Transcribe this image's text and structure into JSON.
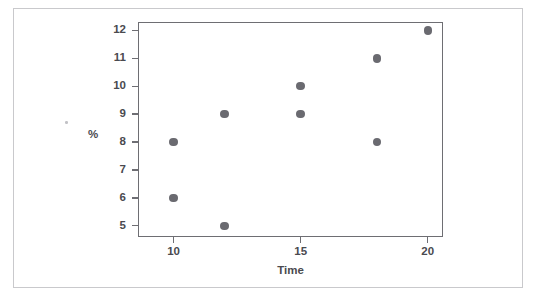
{
  "figure": {
    "background_color": "#ffffff",
    "frame_color": "#c9c9cc",
    "axis_color": "#6e6e73",
    "point_color": "#6a6a70",
    "text_color": "#4a4a4f"
  },
  "chart_data": {
    "type": "scatter",
    "title": "",
    "subtitle": "",
    "xlabel": "Time",
    "ylabel": "%",
    "xlim": [
      8.6,
      20.6
    ],
    "ylim": [
      4.6,
      12.3
    ],
    "xticks": [
      10,
      15,
      20
    ],
    "xticklabels": [
      "10",
      "15",
      "20"
    ],
    "yticks": [
      5,
      6,
      7,
      8,
      9,
      10,
      11,
      12
    ],
    "yticklabels": [
      "5",
      "6",
      "7",
      "8",
      "9",
      "10",
      "11",
      "12"
    ],
    "grid": false,
    "legend": null,
    "legend_position": "none",
    "marker": "filled-circle",
    "marker_color": "#6a6a70",
    "points": [
      {
        "x": 10,
        "y": 8
      },
      {
        "x": 10,
        "y": 6
      },
      {
        "x": 12,
        "y": 9
      },
      {
        "x": 12,
        "y": 5
      },
      {
        "x": 15,
        "y": 10
      },
      {
        "x": 15,
        "y": 9
      },
      {
        "x": 18,
        "y": 11
      },
      {
        "x": 18,
        "y": 8
      },
      {
        "x": 20,
        "y": 12
      }
    ],
    "x": [
      10,
      10,
      12,
      12,
      15,
      15,
      18,
      18,
      20
    ],
    "values": [
      8,
      6,
      9,
      5,
      10,
      9,
      11,
      8,
      12
    ],
    "annotations": []
  }
}
